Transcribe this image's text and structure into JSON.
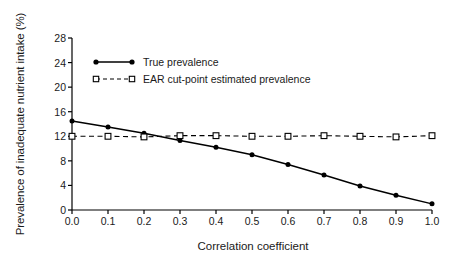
{
  "chart_data": {
    "type": "line",
    "title": "",
    "xlabel": "Correlation coefficient",
    "ylabel": "Prevalence of inadequate nutrient intake (%)",
    "xlim": [
      0.0,
      1.0
    ],
    "ylim": [
      0,
      28
    ],
    "xticks": [
      "0.0",
      "0.1",
      "0.2",
      "0.3",
      "0.4",
      "0.5",
      "0.6",
      "0.7",
      "0.8",
      "0.9",
      "1.0"
    ],
    "xtick_values": [
      0.0,
      0.1,
      0.2,
      0.3,
      0.4,
      0.5,
      0.6,
      0.7,
      0.8,
      0.9,
      1.0
    ],
    "yticks": [
      "0",
      "4",
      "8",
      "12",
      "16",
      "20",
      "24",
      "28"
    ],
    "ytick_values": [
      0,
      4,
      8,
      12,
      16,
      20,
      24,
      28
    ],
    "grid": false,
    "legend_position": "upper left",
    "x": [
      0.0,
      0.1,
      0.2,
      0.3,
      0.4,
      0.5,
      0.6,
      0.7,
      0.8,
      0.9,
      1.0
    ],
    "series": [
      {
        "name": "True prevalence",
        "marker": "filled-circle",
        "linestyle": "solid",
        "color": "#000000",
        "values": [
          14.5,
          13.5,
          12.5,
          11.3,
          10.2,
          9.0,
          7.4,
          5.7,
          3.9,
          2.4,
          1.0
        ]
      },
      {
        "name": "EAR cut-point estimated prevalence",
        "marker": "open-square",
        "linestyle": "dashed",
        "color": "#000000",
        "values": [
          12.0,
          12.0,
          11.9,
          12.1,
          12.1,
          12.0,
          12.0,
          12.1,
          12.0,
          11.9,
          12.1
        ]
      }
    ],
    "annotations": []
  },
  "legend": {
    "items": [
      {
        "label": "True prevalence"
      },
      {
        "label": "EAR cut-point estimated prevalence"
      }
    ]
  }
}
